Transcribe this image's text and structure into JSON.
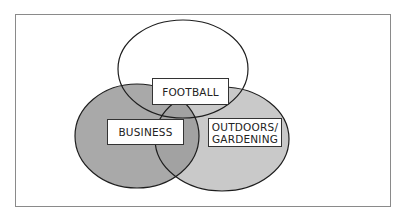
{
  "diagram": {
    "type": "venn",
    "sets": [
      {
        "id": "football",
        "label": "FOOTBALL",
        "fill": "#ffffff"
      },
      {
        "id": "business",
        "label": "BUSINESS",
        "fill": "#a9a9a9"
      },
      {
        "id": "outdoors",
        "label": "OUTDOORS/\nGARDENING",
        "fill": "#c9c9c9"
      }
    ],
    "labels": {
      "football": "FOOTBALL",
      "business": "BUSINESS",
      "outdoors_line1": "OUTDOORS/",
      "outdoors_line2": "GARDENING"
    },
    "colors": {
      "stroke": "#1e1e1e",
      "business_fill": "#a9a9a9",
      "outdoors_fill": "#c9c9c9",
      "overlap_business_outdoors": "#a2a2a2",
      "frame_border": "#8a8a8a"
    }
  }
}
